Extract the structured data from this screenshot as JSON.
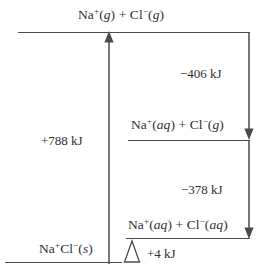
{
  "chart_data": {
    "type": "diagram",
    "title": "",
    "subtitle": "",
    "xlabel": "",
    "ylabel": "",
    "levels": [
      {
        "id": "gas-ions",
        "label_html": "Na<sup>+</sup>(<i>g</i>) + Cl<sup>−</sup>(<i>g</i>)",
        "label_text": "Na+(g) + Cl-(g)",
        "relative_energy": 788
      },
      {
        "id": "aq-na-gas-cl",
        "label_html": "Na<sup>+</sup>(<i>aq</i>) + Cl<sup>−</sup>(<i>g</i>)",
        "label_text": "Na+(aq) + Cl-(g)",
        "relative_energy": 382
      },
      {
        "id": "aq-ions",
        "label_html": "Na<sup>+</sup>(<i>aq</i>) + Cl<sup>−</sup>(<i>aq</i>)",
        "label_text": "Na+(aq) + Cl-(aq)",
        "relative_energy": 4
      },
      {
        "id": "solid-salt",
        "label_html": "Na<sup>+</sup>Cl<sup>−</sup>(<i>s</i>)",
        "label_text": "Na+Cl-(s)",
        "relative_energy": 0
      }
    ],
    "transitions": [
      {
        "id": "lattice-energy",
        "value_text": "+788 kJ",
        "value": 788,
        "unit": "kJ",
        "direction": "up",
        "from": "solid-salt",
        "to": "gas-ions"
      },
      {
        "id": "na-hydration",
        "value_text": "−406 kJ",
        "value": -406,
        "unit": "kJ",
        "direction": "down",
        "from": "gas-ions",
        "to": "aq-na-gas-cl"
      },
      {
        "id": "cl-hydration",
        "value_text": "−378 kJ",
        "value": -378,
        "unit": "kJ",
        "direction": "down",
        "from": "aq-na-gas-cl",
        "to": "aq-ions"
      },
      {
        "id": "net-enthalpy-of-solution",
        "value_text": "+4 kJ",
        "value": 4,
        "unit": "kJ",
        "direction": "up",
        "from": "solid-salt",
        "to": "aq-ions"
      }
    ]
  },
  "diagram": {
    "top_level_label": "Na<sup>+</sup>(<i>g</i>) + Cl<sup>−</sup>(<i>g</i>)",
    "middle_level_label": "Na<sup>+</sup>(<i>aq</i>) + Cl<sup>−</sup>(<i>g</i>)",
    "lower_level_label": "Na<sup>+</sup>(<i>aq</i>) + Cl<sup>−</sup>(<i>aq</i>)",
    "bottom_level_label": "Na<sup>+</sup>Cl<sup>−</sup>(<i>s</i>)",
    "lattice_energy_label": "+788 kJ",
    "na_hydration_label": "−406 kJ",
    "cl_hydration_label": "−378 kJ",
    "net_energy_label": "+4 kJ",
    "colors": {
      "line": "#4a4a50",
      "text": "#2e2e33",
      "background": "#ffffff"
    }
  }
}
